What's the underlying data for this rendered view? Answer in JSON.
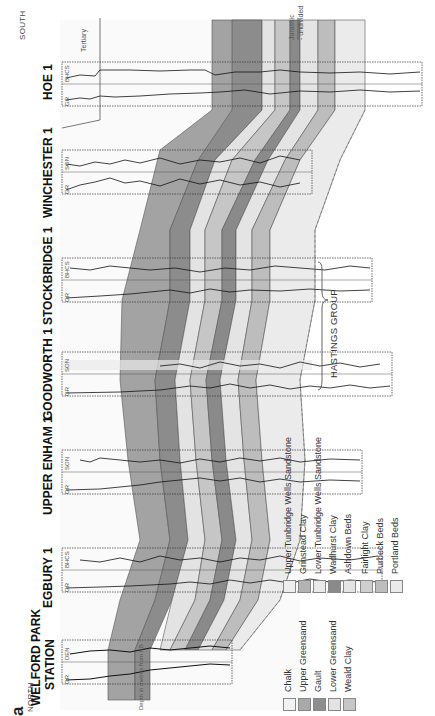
{
  "figure": {
    "panel_letter": "a",
    "north_label": "NORTH",
    "south_label": "SOUTH",
    "depth_axis_label": "Depth in metres from KB",
    "top_label": "Tertiary",
    "bottom_label_1": "Jurassic",
    "bottom_label_2": "- undivided"
  },
  "wells": [
    {
      "name": "WELFORD PARK STATION",
      "name_line1": "WELFORD PARK",
      "name_line2": "STATION",
      "log_left": "GR",
      "log_right": "DEN",
      "scale": "1.9 ... 2.7",
      "depth_ticks": [
        "100",
        "200",
        "300"
      ]
    },
    {
      "name": "EGBURY 1",
      "log_left": "GR",
      "log_right": "BHCS",
      "scale": "140 240 40",
      "depth_ticks": [
        "100",
        "200",
        "300",
        "400",
        "500",
        "600",
        "700"
      ]
    },
    {
      "name": "UPPER ENHAM 1",
      "log_left": "GR",
      "log_right": "SON",
      "scale": "140 240 40",
      "depth_ticks": [
        "100",
        "200",
        "300",
        "400",
        "500",
        "600"
      ]
    },
    {
      "name": "GOODWORTH 1",
      "log_left": "GR",
      "log_right": "SON",
      "scale": "140 240 40",
      "depth_ticks": [
        "100",
        "200",
        "300",
        "400",
        "500",
        "600",
        "700",
        "800",
        "900"
      ]
    },
    {
      "name": "STOCKBRIDGE 1",
      "log_left": "GR",
      "log_right": "BHCS",
      "scale": "140 240 40",
      "depth_ticks": [
        "100",
        "200",
        "300",
        "400",
        "500",
        "600",
        "700",
        "800",
        "900"
      ]
    },
    {
      "name": "WINCHESTER 1",
      "log_left": "GR",
      "log_right": "SON",
      "scale": "140 240 40",
      "depth_ticks": [
        "100",
        "200",
        "300",
        "400",
        "500",
        "600",
        "700"
      ]
    },
    {
      "name": "HOE 1",
      "log_left": "GR",
      "log_right": "BHCS",
      "scale": "140 240 40",
      "depth_ticks": [
        "100",
        "200",
        "300",
        "400",
        "500",
        "600",
        "700",
        "800"
      ]
    }
  ],
  "legend": {
    "left_column": [
      {
        "label": "Chalk",
        "color": "#f2f2f2"
      },
      {
        "label": "Upper Greensand",
        "color": "#a9a9a9"
      },
      {
        "label": "Gault",
        "color": "#8e8e8e"
      },
      {
        "label": "Lower Greensand",
        "color": "#e3e3e3"
      },
      {
        "label": "Weald Clay",
        "color": "#c6c6c6"
      }
    ],
    "right_column": [
      {
        "label": "Upper Tunbridge Wells Sandstone",
        "color": "#eeeeee"
      },
      {
        "label": "Grinstead Clay",
        "color": "#b3b3b3"
      },
      {
        "label": "Lower Tunbridge Wells Sandstone",
        "color": "#e9e9e9"
      },
      {
        "label": "Wadhurst Clay",
        "color": "#8a8a8a"
      },
      {
        "label": "Ashdown Beds",
        "color": "#e4e4e4"
      },
      {
        "label": "Fairlight Clay",
        "color": "#cfcfcf"
      },
      {
        "label": "Purbeck Beds",
        "color": "#bdbdbd"
      },
      {
        "label": "Portland Beds",
        "color": "#ebebeb"
      }
    ],
    "group_label": "HASTINGS GROUP"
  }
}
